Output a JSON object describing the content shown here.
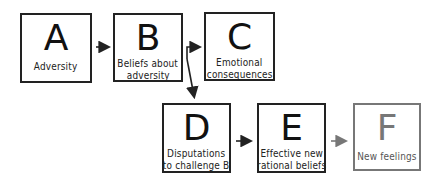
{
  "diagram": {
    "boxes": [
      {
        "id": "A",
        "letter": "A",
        "label_lines": [
          "Adversity"
        ]
      },
      {
        "id": "B",
        "letter": "B",
        "label_lines": [
          "Beliefs about",
          "adversity"
        ]
      },
      {
        "id": "C",
        "letter": "C",
        "label_lines": [
          "Emotional",
          "consequences"
        ]
      },
      {
        "id": "D",
        "letter": "D",
        "label_lines": [
          "Disputations",
          "to challenge B"
        ]
      },
      {
        "id": "E",
        "letter": "E",
        "label_lines": [
          "Effective new",
          "rational beliefs"
        ]
      },
      {
        "id": "F",
        "letter": "F",
        "label_lines": [
          "New feelings"
        ]
      }
    ],
    "edges": [
      {
        "from": "A",
        "to": "B"
      },
      {
        "from": "B",
        "to": "C"
      },
      {
        "from": "B",
        "to": "D"
      },
      {
        "from": "D",
        "to": "E"
      },
      {
        "from": "E",
        "to": "F"
      }
    ],
    "colors": {
      "stroke": "#222222",
      "muted": "#777777"
    }
  }
}
